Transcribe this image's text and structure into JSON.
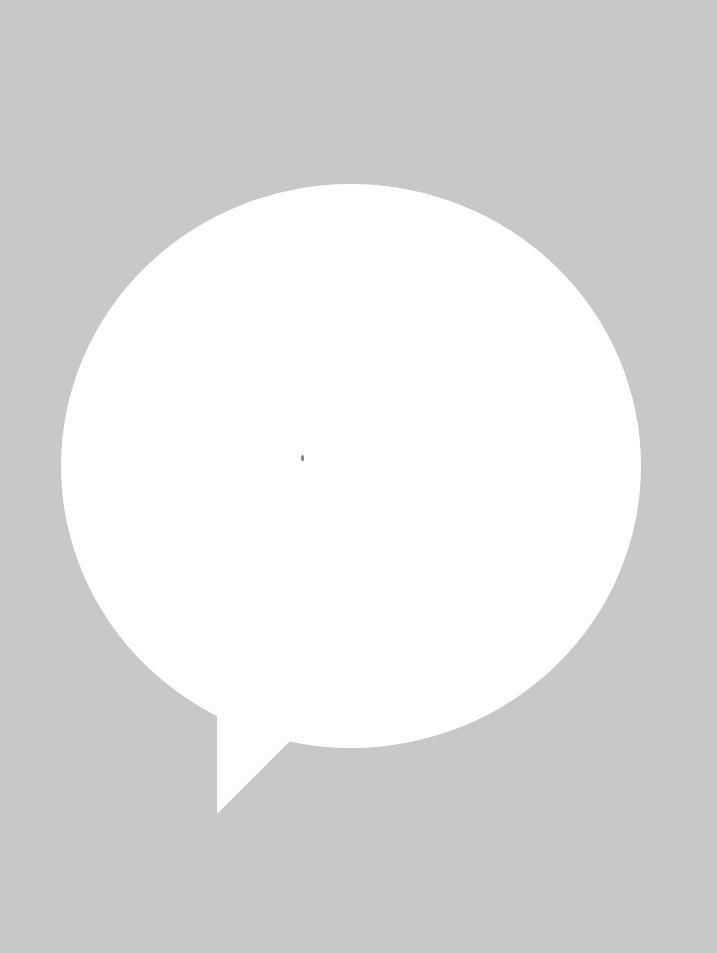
{
  "graphic": {
    "description": "Speech bubble",
    "icon": "speech-bubble-icon",
    "colors": {
      "background": "#c8c8c8",
      "bubble": "#ffffff",
      "speck": "#555555"
    }
  }
}
